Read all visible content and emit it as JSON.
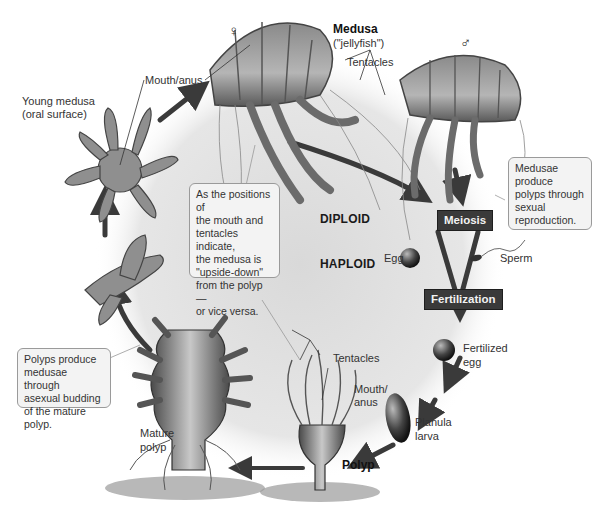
{
  "diagram": {
    "type": "life-cycle",
    "colors": {
      "background_ring": "#e3e3e3",
      "arrow": "#3a3a3a",
      "step_box_bg": "#3a3a3a",
      "step_box_text": "#f2f2f2",
      "callout_bg": "#f3f3f3",
      "callout_border": "#9a9a9a"
    },
    "labels": {
      "female_symbol": "♀",
      "male_symbol": "♂",
      "medusa_title": "Medusa",
      "medusa_subtitle": "(\"jellyfish\")",
      "tentacles_top": "Tentacles",
      "mouth_anus_top": "Mouth/anus",
      "young_medusa_line1": "Young medusa",
      "young_medusa_line2": "(oral surface)",
      "egg": "Egg",
      "sperm": "Sperm",
      "fertilized_egg_line1": "Fertilized",
      "fertilized_egg_line2": "egg",
      "planula_line1": "Planula",
      "planula_line2": "larva",
      "polyp": "Polyp",
      "tentacles_polyp": "Tentacles",
      "mouth_anus_polyp_line1": "Mouth/",
      "mouth_anus_polyp_line2": "anus",
      "mature_polyp_line1": "Mature",
      "mature_polyp_line2": "polyp"
    },
    "phases": {
      "diploid": "DIPLOID",
      "haploid": "HAPLOID"
    },
    "steps": {
      "meiosis": "Meiosis",
      "fertilization": "Fertilization"
    },
    "callouts": {
      "sexual": "Medusae\nproduce\npolyps through\nsexual\nreproduction.",
      "orientation": "As the positions of\nthe mouth and\ntentacles indicate,\nthe medusa is\n\"upside-down\"\nfrom the polyp—\nor vice versa.",
      "asexual": "Polyps produce\nmedusae through\nasexual budding\nof the mature polyp."
    },
    "cycle_sequence": [
      "Mature polyp",
      "Young medusa",
      "Medusa (jellyfish)",
      "Meiosis",
      "Egg + Sperm",
      "Fertilization",
      "Fertilized egg",
      "Planula larva",
      "Polyp",
      "Mature polyp"
    ]
  }
}
